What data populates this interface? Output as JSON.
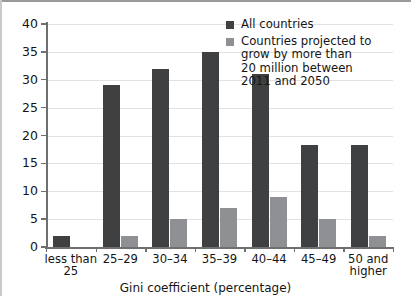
{
  "chart_data": {
    "type": "bar",
    "title": "",
    "subtitle": "",
    "xlabel": "Gini coefficient (percentage)",
    "ylabel": "",
    "ylim": [
      0,
      40
    ],
    "ytick_step": 5,
    "yticks": [
      "40",
      "35",
      "30",
      "25",
      "20",
      "15",
      "10",
      "5",
      "0"
    ],
    "grid": true,
    "legend_position": "top-right",
    "categories": [
      "less than\n25",
      "25–29",
      "30–34",
      "35–39",
      "40–44",
      "45–49",
      "50 and\nhigher"
    ],
    "series": [
      {
        "name": "All countries",
        "color": "#3f4042",
        "values": [
          2,
          29,
          32,
          35,
          31,
          18.3,
          18.3
        ]
      },
      {
        "name": "Countries projected to grow by more than 20 million between 2011 and 2050",
        "color": "#8f9093",
        "values": [
          0,
          2,
          5,
          7,
          9,
          5,
          2
        ]
      }
    ]
  },
  "axes": {
    "x_title": "Gini coefficient (percentage)",
    "categories": [
      {
        "line1": "less than",
        "line2": "25"
      },
      {
        "line1": "25–29",
        "line2": ""
      },
      {
        "line1": "30–34",
        "line2": ""
      },
      {
        "line1": "35–39",
        "line2": ""
      },
      {
        "line1": "40–44",
        "line2": ""
      },
      {
        "line1": "45–49",
        "line2": ""
      },
      {
        "line1": "50 and",
        "line2": "higher"
      }
    ],
    "yticks": [
      "40",
      "35",
      "30",
      "25",
      "20",
      "15",
      "10",
      "5",
      "0"
    ]
  },
  "legend": {
    "items": [
      {
        "label": "All countries",
        "color": "#3f4042"
      },
      {
        "label": "Countries projected to\ngrow by more than\n20 million between\n2011 and 2050",
        "color": "#8f9093"
      }
    ],
    "item2_lines": {
      "l1": "Countries projected to",
      "l2": "grow by more than",
      "l3": "20 million between",
      "l4": "2011 and 2050"
    }
  },
  "colors": {
    "series_dark": "#3f4042",
    "series_light": "#8f9093",
    "grid": "#e2e2e2",
    "axis": "#6f6f6f",
    "text": "#151515",
    "background": "#ffffff"
  }
}
